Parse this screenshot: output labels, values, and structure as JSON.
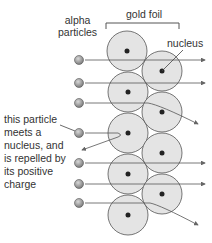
{
  "labels": {
    "alpha": [
      "alpha",
      "particles"
    ],
    "foil": "gold foil",
    "nucleus": "nucleus",
    "annotation": [
      "this particle",
      "meets a",
      "nucleus, and",
      "is repelled by",
      "its positive",
      "charge"
    ]
  },
  "particle_symbol": "+",
  "colors": {
    "atom_fill": "#e4e4e4",
    "atom_stroke": "#555555",
    "nucleus": "#222222",
    "particle": "#9a9a9a",
    "path": "#555555"
  },
  "atoms_left": [
    [
      127,
      51
    ],
    [
      128,
      92
    ],
    [
      128,
      133
    ],
    [
      128,
      174
    ],
    [
      128,
      215
    ]
  ],
  "atoms_right": [
    [
      162,
      71
    ],
    [
      162,
      112
    ],
    [
      162,
      153
    ],
    [
      162,
      194
    ]
  ],
  "particles_y": [
    60,
    83,
    103,
    133,
    163,
    184,
    203
  ]
}
